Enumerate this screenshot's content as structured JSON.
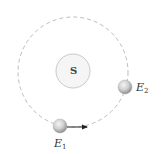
{
  "diagram": {
    "title": "",
    "sun": {
      "label": "S",
      "center": [
        73,
        71
      ],
      "radius": 17
    },
    "orbit": {
      "style": "dashed",
      "center": [
        73,
        72
      ],
      "radius": 55
    },
    "bodies": [
      {
        "id": "E1",
        "label_main": "E",
        "label_sub": "1",
        "position": [
          60,
          126
        ],
        "radius": 7,
        "velocity_arrow": {
          "direction": "right",
          "to": [
            88,
            127
          ]
        }
      },
      {
        "id": "E2",
        "label_main": "E",
        "label_sub": "2",
        "position": [
          125,
          87
        ],
        "radius": 7
      }
    ],
    "colors": {
      "orbit": "#b8b8b8",
      "sun_stroke": "#c8c8c8",
      "sun_fill": "#f4f4f4",
      "sphere_light": "#f2f2f2",
      "sphere_dark": "#9a9a9a",
      "arrow": "#222222",
      "text": "#333333"
    }
  }
}
